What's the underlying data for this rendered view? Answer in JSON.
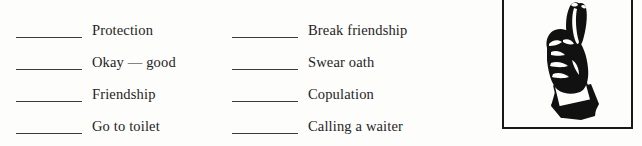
{
  "page": {
    "background_color": "#fdfdfb",
    "ink_color": "#25231f",
    "rule_color": "#3a3a3a"
  },
  "exercise": {
    "columns": [
      {
        "name": "left-column",
        "rows": [
          {
            "blank": "",
            "label": "Protection"
          },
          {
            "blank": "",
            "label": "Okay — good"
          },
          {
            "blank": "",
            "label": "Friendship"
          },
          {
            "blank": "",
            "label": "Go to toilet"
          }
        ]
      },
      {
        "name": "right-column",
        "rows": [
          {
            "blank": "",
            "label": "Break friendship"
          },
          {
            "blank": "",
            "label": "Swear oath"
          },
          {
            "blank": "",
            "label": "Copulation"
          },
          {
            "blank": "",
            "label": "Calling a waiter"
          }
        ]
      }
    ]
  },
  "illustration": {
    "name": "crossed-fingers-hand-illustration",
    "description": "Black and white line drawing of a hand with index and middle fingers crossed, raised upward, wearing a white shirt cuff and dark suit sleeve",
    "border_color": "#16181a",
    "ink_color": "#111111"
  }
}
